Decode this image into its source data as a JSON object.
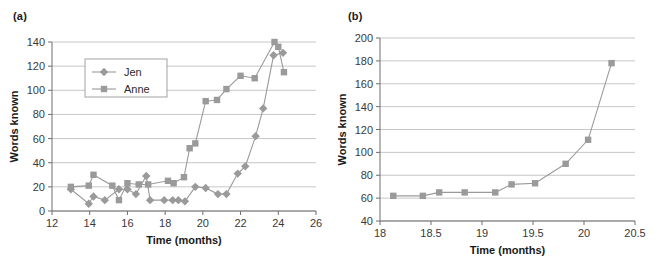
{
  "figure": {
    "panel_a_label": "(a)",
    "panel_b_label": "(b)",
    "marker_color_jen": "#9a9a9a",
    "marker_color_anne": "#9a9a9a",
    "line_color": "#9a9a9a",
    "grid_color": "#b9b9b9",
    "axis_color": "#6e6e6e"
  },
  "chart_data": [
    {
      "id": "panel-a",
      "type": "line",
      "title": "(a)",
      "xlabel": "Time (months)",
      "ylabel": "Words known",
      "xlim": [
        12,
        26
      ],
      "ylim": [
        0,
        140
      ],
      "xticks": [
        12,
        14,
        16,
        18,
        20,
        22,
        24,
        26
      ],
      "yticks": [
        0,
        20,
        40,
        60,
        80,
        100,
        120,
        140
      ],
      "grid": true,
      "legend_position": "upper-left-inside",
      "legend": [
        "Jen",
        "Anne"
      ],
      "series": [
        {
          "name": "Jen",
          "marker": "diamond",
          "color": "#9a9a9a",
          "points": [
            [
              13.0,
              18
            ],
            [
              13.95,
              6
            ],
            [
              14.2,
              12
            ],
            [
              14.8,
              9
            ],
            [
              15.55,
              18
            ],
            [
              16.0,
              18
            ],
            [
              16.45,
              14
            ],
            [
              17.0,
              29
            ],
            [
              17.2,
              9
            ],
            [
              17.95,
              9
            ],
            [
              18.4,
              9
            ],
            [
              18.7,
              9
            ],
            [
              19.05,
              8
            ],
            [
              19.6,
              20
            ],
            [
              20.15,
              19
            ],
            [
              20.8,
              14
            ],
            [
              21.25,
              14
            ],
            [
              21.85,
              31
            ],
            [
              22.25,
              37
            ],
            [
              22.8,
              62
            ],
            [
              23.2,
              85
            ],
            [
              23.75,
              129
            ],
            [
              24.25,
              131
            ]
          ]
        },
        {
          "name": "Anne",
          "marker": "square",
          "color": "#9a9a9a",
          "points": [
            [
              13.0,
              20
            ],
            [
              13.95,
              21
            ],
            [
              14.2,
              30
            ],
            [
              15.2,
              21
            ],
            [
              15.55,
              9
            ],
            [
              16.0,
              23
            ],
            [
              16.6,
              22
            ],
            [
              17.1,
              22
            ],
            [
              18.15,
              25
            ],
            [
              18.45,
              23
            ],
            [
              19.0,
              28
            ],
            [
              19.3,
              52
            ],
            [
              19.6,
              56
            ],
            [
              20.15,
              91
            ],
            [
              20.75,
              92
            ],
            [
              21.25,
              101
            ],
            [
              22.0,
              112
            ],
            [
              22.75,
              110
            ],
            [
              23.8,
              140
            ],
            [
              24.0,
              136
            ],
            [
              24.3,
              115
            ]
          ]
        }
      ]
    },
    {
      "id": "panel-b",
      "type": "line",
      "title": "(b)",
      "xlabel": "Time (months)",
      "ylabel": "Words known",
      "xlim": [
        18,
        20.5
      ],
      "ylim": [
        40,
        200
      ],
      "xticks": [
        18,
        18.5,
        19,
        19.5,
        20,
        20.5
      ],
      "xtick_labels": [
        "18",
        "18.5",
        "19",
        "19.5",
        "20",
        "20.5"
      ],
      "yticks": [
        40,
        60,
        80,
        100,
        120,
        140,
        160,
        180,
        200
      ],
      "grid": true,
      "legend_position": "none",
      "series": [
        {
          "name": "Anne",
          "marker": "square",
          "color": "#9a9a9a",
          "points": [
            [
              18.13,
              62
            ],
            [
              18.42,
              62
            ],
            [
              18.58,
              65
            ],
            [
              18.83,
              65
            ],
            [
              19.13,
              65
            ],
            [
              19.29,
              72
            ],
            [
              19.52,
              73
            ],
            [
              19.82,
              90
            ],
            [
              20.04,
              111
            ],
            [
              20.27,
              178
            ]
          ]
        }
      ]
    }
  ]
}
